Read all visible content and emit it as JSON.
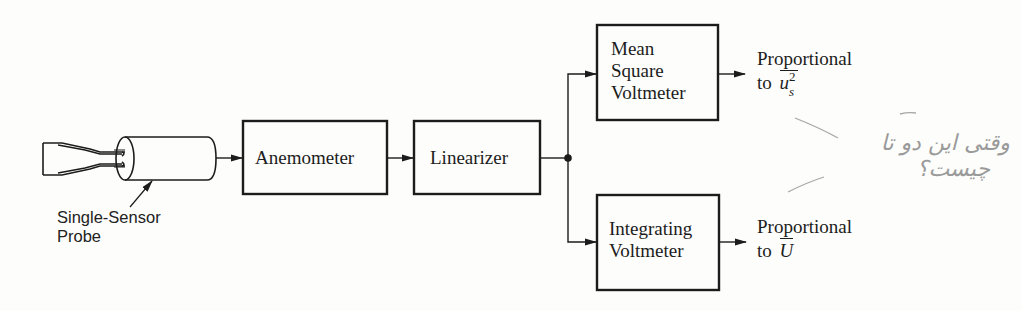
{
  "diagram": {
    "type": "block-diagram",
    "probe": {
      "label_line1": "Single-Sensor",
      "label_line2": "Probe"
    },
    "blocks": [
      {
        "id": "anemometer",
        "label": "Anemometer"
      },
      {
        "id": "linearizer",
        "label": "Linearizer"
      },
      {
        "id": "mean-square-voltmeter",
        "lines": [
          "Mean",
          "Square",
          "Voltmeter"
        ]
      },
      {
        "id": "integrating-voltmeter",
        "lines": [
          "Integrating",
          "Voltmeter"
        ]
      }
    ],
    "outputs": {
      "top": {
        "line1": "Proportional",
        "prefix": "to",
        "symbol": "u",
        "subscript": "s",
        "superscript": "2"
      },
      "bottom": {
        "line1": "Proportional",
        "prefix": "to",
        "symbol": "U"
      }
    },
    "edges": [
      [
        "probe",
        "anemometer"
      ],
      [
        "anemometer",
        "linearizer"
      ],
      [
        "linearizer",
        "junction"
      ],
      [
        "junction",
        "mean-square-voltmeter"
      ],
      [
        "junction",
        "integrating-voltmeter"
      ],
      [
        "mean-square-voltmeter",
        "output-top"
      ],
      [
        "integrating-voltmeter",
        "output-bottom"
      ]
    ],
    "annotation": {
      "handwritten_line1": "وقتی این دو تا",
      "handwritten_line2": "چیست؟"
    }
  },
  "colors": {
    "ink": "#1c1c1c",
    "paper": "#fdfdfb",
    "pencil": "#9a9a9a"
  }
}
